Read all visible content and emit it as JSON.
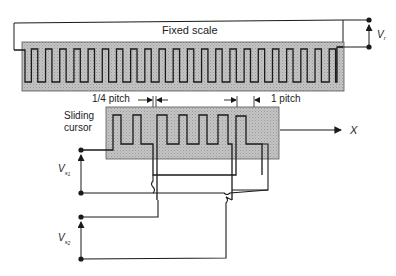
{
  "labels": {
    "fixed_scale": "Fixed scale",
    "sliding_cursor_line1": "Sliding",
    "sliding_cursor_line2": "cursor",
    "quarter_pitch": "1/4 pitch",
    "one_pitch": "1 pitch",
    "direction": "X",
    "vr_main": "V",
    "vr_sub": "r",
    "vs1_main": "V",
    "vs1_sub": "s",
    "vs1_subsub": "1",
    "vs2_main": "V",
    "vs2_sub": "s",
    "vs2_subsub": "2"
  },
  "components": {
    "scale_periods": 22,
    "cursor_windings": 2
  },
  "colors": {
    "line": "#1a1a1a",
    "fill": "#bdbdbd",
    "text": "#222222"
  }
}
